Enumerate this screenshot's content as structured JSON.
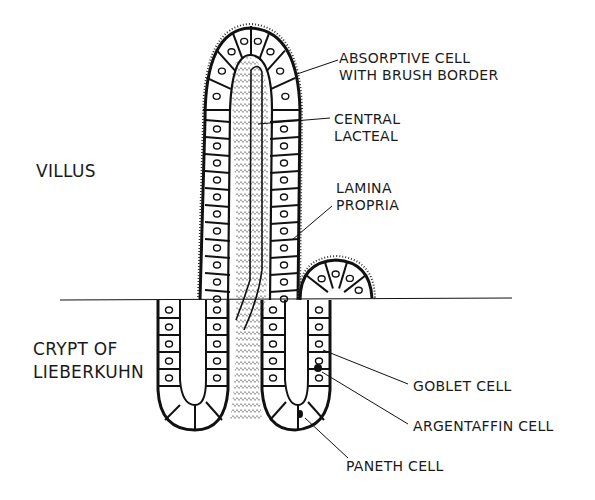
{
  "diagram": {
    "regions": {
      "villus": "VILLUS",
      "crypt_line1": "CRYPT OF",
      "crypt_line2": "LIEBERKUHN"
    },
    "labels": {
      "absorptive_line1": "ABSORPTIVE CELL",
      "absorptive_line2": "WITH BRUSH BORDER",
      "lacteal_line1": "CENTRAL",
      "lacteal_line2": "LACTEAL",
      "lamina_line1": "LAMINA",
      "lamina_line2": "PROPRIA",
      "goblet": "GOBLET CELL",
      "argentaffin": "ARGENTAFFIN CELL",
      "paneth": "PANETH CELL"
    },
    "colors": {
      "ink": "#111111",
      "paper": "#ffffff"
    }
  }
}
